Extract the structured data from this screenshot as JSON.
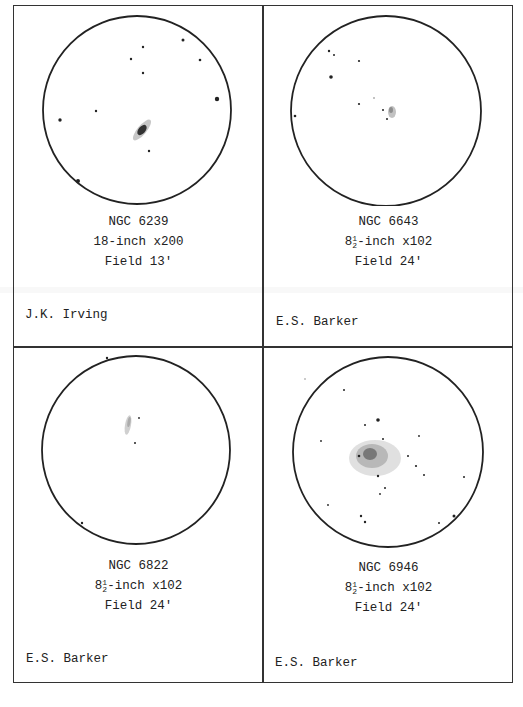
{
  "document": {
    "type": "Observation sketches",
    "layout": "2x2 grid"
  },
  "panels": [
    {
      "object": "NGC 6239",
      "aperture": "18-inch",
      "magnification": "x200",
      "instrument_line": "18-inch x200",
      "field": "Field 13'",
      "observer": "J.K. Irving",
      "sketch": "galaxy-elongated"
    },
    {
      "object": "NGC 6643",
      "aperture_whole": "8",
      "aperture_frac_num": "1",
      "aperture_frac_den": "2",
      "aperture_suffix": "-inch x102",
      "instrument_line": "8½-inch x102",
      "field": "Field 24'",
      "observer": "E.S. Barker",
      "sketch": "faint-galaxy"
    },
    {
      "object": "NGC 6822",
      "aperture_whole": "8",
      "aperture_frac_num": "1",
      "aperture_frac_den": "2",
      "aperture_suffix": "-inch x102",
      "instrument_line": "8½-inch x102",
      "field": "Field 24'",
      "observer": "E.S. Barker",
      "sketch": "irregular-galaxy"
    },
    {
      "object": "NGC 6946",
      "aperture_whole": "8",
      "aperture_frac_num": "1",
      "aperture_frac_den": "2",
      "aperture_suffix": "-inch x102",
      "instrument_line": "8½-inch x102",
      "field": "Field 24'",
      "observer": "E.S. Barker",
      "sketch": "face-on-spiral"
    }
  ]
}
